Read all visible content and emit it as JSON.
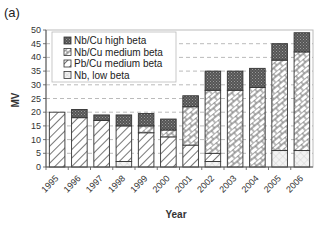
{
  "panel_label": "(a)",
  "chart_data": {
    "type": "bar",
    "stacked": true,
    "title": "",
    "xlabel": "Year",
    "ylabel": "MV",
    "ylim": [
      0,
      50
    ],
    "yticks": [
      0,
      5,
      10,
      15,
      20,
      25,
      30,
      35,
      40,
      45,
      50
    ],
    "grid": "horizontal dashed",
    "legend_position": "upper left (inside)",
    "categories": [
      "1995",
      "1996",
      "1997",
      "1998",
      "1999",
      "2000",
      "2001",
      "2002",
      "2003",
      "2004",
      "2005",
      "2006"
    ],
    "series": [
      {
        "name": "Nb, low beta",
        "pattern": "crosshatch-light",
        "values": [
          0,
          0,
          0,
          2,
          0,
          0,
          0,
          2,
          0,
          0,
          6,
          6
        ]
      },
      {
        "name": "Pb/Cu medium beta",
        "pattern": "diagonal-stripes",
        "values": [
          20,
          18,
          17,
          13,
          12.5,
          11,
          8,
          3,
          0,
          0,
          0,
          0
        ]
      },
      {
        "name": "Nb/Cu medium beta",
        "pattern": "brick-diagonal",
        "values": [
          0,
          0,
          0,
          0,
          2.5,
          2.5,
          14,
          23,
          28,
          29,
          33,
          36
        ]
      },
      {
        "name": "Nb/Cu high beta",
        "pattern": "dark-dots",
        "values": [
          0,
          3,
          2,
          4,
          4.5,
          4,
          4,
          7,
          7,
          7,
          6,
          7
        ]
      }
    ],
    "legend": [
      "Nb/Cu high beta",
      "Nb/Cu medium beta",
      "Pb/Cu medium beta",
      "Nb, low beta"
    ]
  }
}
